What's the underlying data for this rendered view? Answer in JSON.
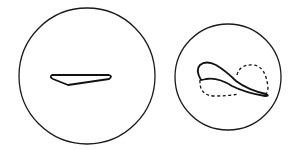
{
  "figure": {
    "panels": [
      {
        "id": "left",
        "description": "Large circle containing a flat elongated wedge shape",
        "circle": {
          "cx": 87,
          "cy": 76,
          "r": 68
        },
        "shape": "elongated-wedge"
      },
      {
        "id": "right",
        "description": "Smaller circle containing a curved solid outline with a dashed loop",
        "circle": {
          "cx": 228,
          "cy": 77,
          "r": 53
        },
        "shape": "curved-loop-with-dashed-outline"
      }
    ],
    "colors": {
      "stroke": "#111111",
      "background": "#ffffff"
    }
  }
}
